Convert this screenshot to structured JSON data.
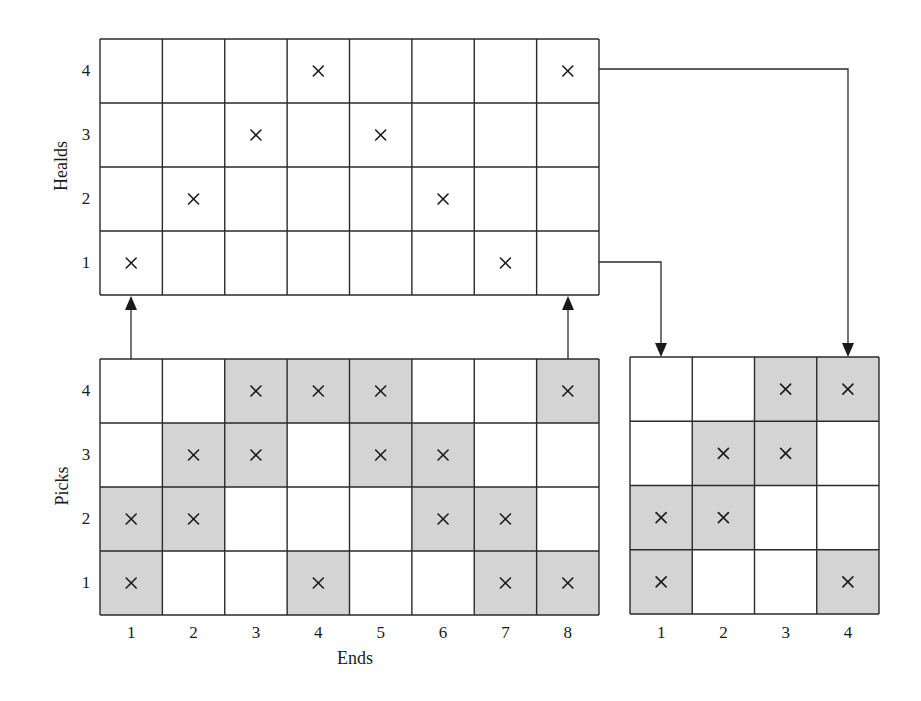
{
  "diagram": {
    "heald_draft": {
      "ylabel": "Healds",
      "row_labels": [
        "4",
        "3",
        "2",
        "1"
      ],
      "cols": 8,
      "rows": 4,
      "marks": [
        {
          "end": 1,
          "heald": 1
        },
        {
          "end": 2,
          "heald": 2
        },
        {
          "end": 3,
          "heald": 3
        },
        {
          "end": 4,
          "heald": 4
        },
        {
          "end": 5,
          "heald": 3
        },
        {
          "end": 6,
          "heald": 2
        },
        {
          "end": 7,
          "heald": 1
        },
        {
          "end": 8,
          "heald": 4
        }
      ]
    },
    "weave_design": {
      "ylabel": "Picks",
      "xlabel": "Ends",
      "row_labels": [
        "4",
        "3",
        "2",
        "1"
      ],
      "col_labels": [
        "1",
        "2",
        "3",
        "4",
        "5",
        "6",
        "7",
        "8"
      ],
      "cols": 8,
      "rows": 4,
      "marked_cells_by_pick": {
        "4": [
          3,
          4,
          5,
          8
        ],
        "3": [
          2,
          3,
          5,
          6
        ],
        "2": [
          1,
          2,
          6,
          7
        ],
        "1": [
          1,
          4,
          7,
          8
        ]
      }
    },
    "lifting_plan": {
      "col_labels": [
        "1",
        "2",
        "3",
        "4"
      ],
      "cols": 4,
      "rows": 4,
      "marked_cells_by_pick": {
        "4": [
          3,
          4
        ],
        "3": [
          2,
          3
        ],
        "2": [
          1,
          2
        ],
        "1": [
          1,
          4
        ]
      }
    },
    "connectors": [
      {
        "from": "weave_design end 1",
        "to": "heald_draft end 1",
        "direction": "up"
      },
      {
        "from": "weave_design end 8",
        "to": "heald_draft end 8",
        "direction": "up"
      },
      {
        "from": "heald_draft heald 1",
        "to": "lifting_plan shaft 1",
        "direction": "down"
      },
      {
        "from": "heald_draft heald 4",
        "to": "lifting_plan shaft 4",
        "direction": "down"
      }
    ],
    "colors": {
      "shaded_cell": "#d4d4d4",
      "line": "#2a2a2a",
      "background": "#ffffff"
    },
    "mark_symbol": "×"
  }
}
